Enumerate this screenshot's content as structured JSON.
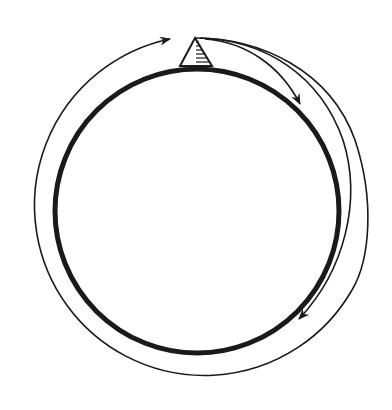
{
  "diagram": {
    "description": "Circular loop with a triangular marker on top and curved arrows around it",
    "colors": {
      "stroke": "#1a1a1a",
      "background": "#ffffff"
    },
    "ring": {
      "cx": 197,
      "cy": 211,
      "r": 142,
      "stroke_width": 5
    },
    "marker": {
      "shape": "hatched-triangle",
      "apex": [
        195,
        38
      ],
      "base_left": [
        180,
        66
      ],
      "base_right": [
        212,
        66
      ],
      "hatch_lines": 7
    },
    "arrows": [
      {
        "name": "outer-loop-arrow",
        "tip": [
          170,
          39
        ],
        "direction": "clockwise-into-marker"
      },
      {
        "name": "short-right-arrow",
        "tip": [
          300,
          104
        ],
        "direction": "from-marker"
      },
      {
        "name": "long-right-arrow",
        "tip": [
          299,
          319
        ],
        "direction": "from-marker"
      }
    ],
    "labels": []
  }
}
